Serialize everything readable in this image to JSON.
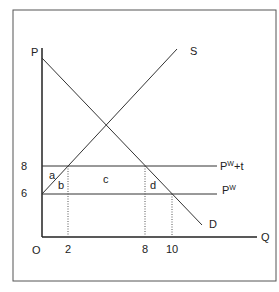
{
  "diagram": {
    "axes": {
      "y_label": "P",
      "x_label": "Q",
      "origin_label": "O"
    },
    "y_ticks": [
      {
        "value": "8",
        "y": 166
      },
      {
        "value": "6",
        "y": 194
      }
    ],
    "x_ticks": [
      {
        "value": "2",
        "x": 68
      },
      {
        "value": "8",
        "x": 145
      },
      {
        "value": "10",
        "x": 172
      }
    ],
    "curves": {
      "supply_label": "S",
      "demand_label": "D"
    },
    "price_lines": {
      "tariff_price_base": "P",
      "tariff_price_sup": "W",
      "tariff_price_suffix": "+t",
      "world_price_base": "P",
      "world_price_sup": "W"
    },
    "areas": {
      "a": "a",
      "b": "b",
      "c": "c",
      "d": "d"
    }
  }
}
